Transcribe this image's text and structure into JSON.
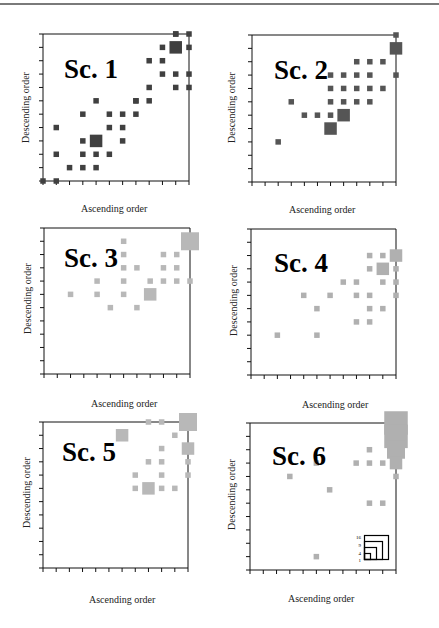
{
  "chart_data": [
    {
      "type": "heatmap",
      "title": "Sc. 1",
      "xlabel": "Ascending order",
      "ylabel": "Descending order",
      "color": "#404040",
      "grid": 11,
      "cells": [
        [
          0,
          0,
          1
        ],
        [
          1,
          0,
          1
        ],
        [
          2,
          1,
          1
        ],
        [
          3,
          1,
          1
        ],
        [
          4,
          1,
          1
        ],
        [
          1,
          2,
          1
        ],
        [
          3,
          2,
          1
        ],
        [
          4,
          2,
          1
        ],
        [
          5,
          2,
          1
        ],
        [
          1,
          4,
          1
        ],
        [
          3,
          3,
          1
        ],
        [
          4,
          3,
          4
        ],
        [
          6,
          3,
          1
        ],
        [
          5,
          4,
          1
        ],
        [
          6,
          4,
          1
        ],
        [
          3,
          5,
          1
        ],
        [
          5,
          5,
          1
        ],
        [
          6,
          5,
          1
        ],
        [
          4,
          6,
          1
        ],
        [
          7,
          6,
          1
        ],
        [
          7,
          5,
          1
        ],
        [
          7,
          6,
          1
        ],
        [
          8,
          6,
          1
        ],
        [
          10,
          11,
          1
        ],
        [
          11,
          11,
          1
        ],
        [
          9,
          10,
          1
        ],
        [
          10,
          10,
          4
        ],
        [
          11,
          10,
          1
        ],
        [
          8,
          9,
          1
        ],
        [
          9,
          9,
          1
        ],
        [
          9,
          8,
          1
        ],
        [
          8,
          7,
          1
        ],
        [
          10,
          8,
          1
        ],
        [
          10,
          7,
          1
        ],
        [
          11,
          8,
          1
        ],
        [
          11,
          7,
          1
        ],
        [
          10,
          11,
          1
        ]
      ]
    },
    {
      "type": "heatmap",
      "title": "Sc. 2",
      "xlabel": "Ascending order",
      "ylabel": "Descending order",
      "color": "#555555",
      "grid": 11,
      "cells": [
        [
          2,
          3,
          1
        ],
        [
          3,
          6,
          1
        ],
        [
          4,
          5,
          1
        ],
        [
          5,
          5,
          1
        ],
        [
          6,
          5,
          1
        ],
        [
          6,
          4,
          4
        ],
        [
          6,
          6,
          1
        ],
        [
          7,
          6,
          1
        ],
        [
          7,
          5,
          4
        ],
        [
          8,
          6,
          1
        ],
        [
          9,
          6,
          1
        ],
        [
          6,
          7,
          1
        ],
        [
          7,
          7,
          1
        ],
        [
          8,
          7,
          1
        ],
        [
          9,
          7,
          1
        ],
        [
          10,
          7,
          1
        ],
        [
          6,
          8,
          1
        ],
        [
          7,
          8,
          1
        ],
        [
          8,
          8,
          1
        ],
        [
          9,
          8,
          1
        ],
        [
          11,
          8,
          1
        ],
        [
          8,
          9,
          1
        ],
        [
          9,
          9,
          1
        ],
        [
          10,
          9,
          1
        ],
        [
          11,
          10,
          4
        ],
        [
          11,
          11,
          1
        ]
      ]
    },
    {
      "type": "heatmap",
      "title": "Sc. 3",
      "xlabel": "Ascending order",
      "ylabel": "Descending order",
      "color": "#b8b8b8",
      "grid": 11,
      "cells": [
        [
          2,
          6,
          1
        ],
        [
          4,
          6,
          1
        ],
        [
          4,
          7,
          1
        ],
        [
          5,
          5,
          1
        ],
        [
          6,
          6,
          1
        ],
        [
          6,
          7,
          1
        ],
        [
          7,
          5,
          1
        ],
        [
          8,
          6,
          4
        ],
        [
          6,
          8,
          1
        ],
        [
          7,
          8,
          1
        ],
        [
          6,
          9,
          1
        ],
        [
          6,
          10,
          1
        ],
        [
          8,
          7,
          1
        ],
        [
          9,
          7,
          1
        ],
        [
          9,
          8,
          1
        ],
        [
          10,
          8,
          1
        ],
        [
          10,
          7,
          1
        ],
        [
          11,
          7,
          1
        ],
        [
          9,
          9,
          1
        ],
        [
          10,
          9,
          1
        ],
        [
          11,
          10,
          9
        ]
      ]
    },
    {
      "type": "heatmap",
      "title": "Sc. 4",
      "xlabel": "Ascending order",
      "ylabel": "Descending order",
      "color": "#b0b0b0",
      "grid": 11,
      "cells": [
        [
          2,
          3,
          1
        ],
        [
          4,
          6,
          1
        ],
        [
          5,
          5,
          1
        ],
        [
          5,
          3,
          1
        ],
        [
          6,
          6,
          1
        ],
        [
          7,
          7,
          1
        ],
        [
          8,
          7,
          1
        ],
        [
          8,
          6,
          1
        ],
        [
          8,
          4,
          1
        ],
        [
          9,
          6,
          1
        ],
        [
          9,
          5,
          1
        ],
        [
          9,
          4,
          1
        ],
        [
          9,
          9,
          1
        ],
        [
          9,
          8,
          1
        ],
        [
          10,
          9,
          1
        ],
        [
          10,
          8,
          4
        ],
        [
          10,
          7,
          1
        ],
        [
          10,
          5,
          1
        ],
        [
          11,
          9,
          4
        ],
        [
          11,
          8,
          1
        ],
        [
          11,
          7,
          1
        ],
        [
          11,
          6,
          1
        ]
      ]
    },
    {
      "type": "heatmap",
      "title": "Sc. 5",
      "xlabel": "Ascending order",
      "ylabel": "Descending order",
      "color": "#b8b8b8",
      "grid": 11,
      "cells": [
        [
          6,
          10,
          4
        ],
        [
          7,
          6,
          1
        ],
        [
          7,
          7,
          1
        ],
        [
          8,
          6,
          4
        ],
        [
          8,
          8,
          1
        ],
        [
          9,
          9,
          1
        ],
        [
          9,
          8,
          1
        ],
        [
          9,
          7,
          1
        ],
        [
          9,
          6,
          1
        ],
        [
          10,
          6,
          1
        ],
        [
          10,
          10,
          1
        ],
        [
          8,
          11,
          1
        ],
        [
          9,
          11,
          1
        ],
        [
          11,
          11,
          9
        ],
        [
          11,
          9,
          4
        ],
        [
          11,
          8,
          1
        ],
        [
          11,
          7,
          1
        ]
      ]
    },
    {
      "type": "heatmap",
      "title": "Sc. 6",
      "xlabel": "Ascending order",
      "ylabel": "Descending order",
      "color": "#b0b0b0",
      "grid": 11,
      "cells": [
        [
          3,
          7,
          1
        ],
        [
          5,
          8,
          1
        ],
        [
          6,
          6,
          1
        ],
        [
          8,
          8,
          1
        ],
        [
          5,
          1,
          1
        ],
        [
          9,
          5,
          1
        ],
        [
          10,
          5,
          1
        ],
        [
          9,
          8,
          1
        ],
        [
          9,
          9,
          1
        ],
        [
          10,
          8,
          1
        ],
        [
          11,
          7,
          1
        ],
        [
          11,
          11,
          16
        ],
        [
          11,
          10,
          16
        ],
        [
          11,
          9,
          9
        ],
        [
          11,
          8,
          4
        ]
      ],
      "legend": {
        "labels": [
          "16",
          "9",
          "4",
          "1"
        ],
        "meaning": "cell count (square area)"
      }
    }
  ],
  "panels": [
    {
      "title": "Sc. 1",
      "xlabel": "Ascending order",
      "ylabel": "Descending order"
    },
    {
      "title": "Sc. 2",
      "xlabel": "Ascending order",
      "ylabel": "Descending order"
    },
    {
      "title": "Sc. 3",
      "xlabel": "Ascending order",
      "ylabel": "Descending order"
    },
    {
      "title": "Sc. 4",
      "xlabel": "Ascending order",
      "ylabel": "Descending order"
    },
    {
      "title": "Sc. 5",
      "xlabel": "Ascending order",
      "ylabel": "Descending order"
    },
    {
      "title": "Sc. 6",
      "xlabel": "Ascending order",
      "ylabel": "Descending order"
    }
  ],
  "legend": {
    "labels": [
      "16",
      "9",
      "4",
      "1"
    ]
  }
}
